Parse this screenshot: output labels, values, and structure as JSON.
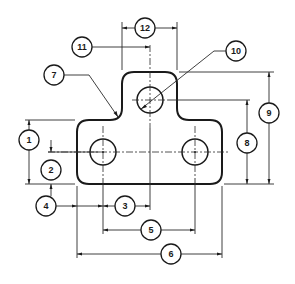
{
  "diagram": {
    "type": "engineering-drawing",
    "colors": {
      "line": "#1a1a1a",
      "background": "#ffffff"
    },
    "balloons": [
      {
        "id": "b1",
        "label": "1",
        "x": 29,
        "y": 140
      },
      {
        "id": "b2",
        "label": "2",
        "x": 51,
        "y": 170
      },
      {
        "id": "b3",
        "label": "3",
        "x": 125,
        "y": 206
      },
      {
        "id": "b4",
        "label": "4",
        "x": 46,
        "y": 206
      },
      {
        "id": "b5",
        "label": "5",
        "x": 151,
        "y": 230
      },
      {
        "id": "b6",
        "label": "6",
        "x": 171,
        "y": 254
      },
      {
        "id": "b7",
        "label": "7",
        "x": 54,
        "y": 75
      },
      {
        "id": "b8",
        "label": "8",
        "x": 247,
        "y": 143
      },
      {
        "id": "b9",
        "label": "9",
        "x": 269,
        "y": 113
      },
      {
        "id": "b10",
        "label": "10",
        "x": 236,
        "y": 51
      },
      {
        "id": "b11",
        "label": "11",
        "x": 82,
        "y": 47
      },
      {
        "id": "b12",
        "label": "12",
        "x": 145,
        "y": 28
      }
    ]
  }
}
